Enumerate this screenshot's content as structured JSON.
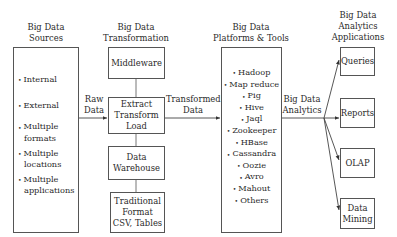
{
  "headings": {
    "sources": [
      "Big Data",
      "Sources"
    ],
    "transformation": [
      "Big Data",
      "Transformation"
    ],
    "platforms": [
      "Big Data",
      "Platforms & Tools"
    ],
    "applications": [
      "Big Data",
      "Analytics",
      "Applications"
    ]
  },
  "sources": {
    "items": [
      {
        "lines": [
          "Internal"
        ]
      },
      {
        "lines": [
          "External"
        ]
      },
      {
        "lines": [
          "Multiple",
          "formats"
        ]
      },
      {
        "lines": [
          "Multiple",
          "locations"
        ]
      },
      {
        "lines": [
          "Multiple",
          "applications"
        ]
      }
    ]
  },
  "transformation": {
    "middleware": "Middleware",
    "etl": [
      "Extract",
      "Transform",
      "Load"
    ],
    "warehouse": [
      "Data",
      "Warehouse"
    ],
    "traditional": [
      "Traditional",
      "Format",
      "CSV, Tables"
    ]
  },
  "platforms": {
    "items": [
      "Hadoop",
      "Map reduce",
      "Pig",
      "Hive",
      "Jaql",
      "Zookeeper",
      "HBase",
      "Cassandra",
      "Oozie",
      "Avro",
      "Mahout",
      "Others"
    ]
  },
  "applications": {
    "queries": "Queries",
    "reports": "Reports",
    "olap": "OLAP",
    "mining": [
      "Data",
      "Mining"
    ]
  },
  "edge_labels": {
    "raw_data": [
      "Raw",
      "Data"
    ],
    "transformed_data": [
      "Transformed",
      "Data"
    ],
    "analytics": [
      "Big Data",
      "Analytics"
    ]
  },
  "bullet": "•",
  "colors": {
    "line": "#555555",
    "text": "#2a2a2a"
  }
}
